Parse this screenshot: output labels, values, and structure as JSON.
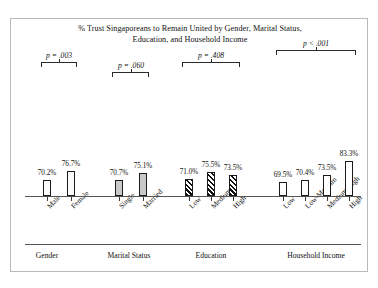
{
  "chart_data": {
    "type": "bar",
    "title": "% Trust Singaporeans to Remain United by Gender, Marital Status, Education, and Household Income",
    "title_line1": "% Trust Singaporeans to Remain United by Gender, Marital Status,",
    "title_line2": "Education, and Household Income",
    "xlabel": "",
    "ylabel": "",
    "ylim": [
      0,
      100
    ],
    "grid": false,
    "legend": "none",
    "value_suffix": "%",
    "groups": [
      {
        "name": "Gender",
        "p_label": "p = .003",
        "fill": "dotted",
        "categories": [
          "Male",
          "Female"
        ],
        "values": [
          70.2,
          76.7
        ],
        "value_labels": [
          "70.2%",
          "76.7%"
        ]
      },
      {
        "name": "Marital Status",
        "p_label": "p = .060",
        "fill": "solid-gray",
        "categories": [
          "Single",
          "Married"
        ],
        "values": [
          70.7,
          75.1
        ],
        "value_labels": [
          "70.7%",
          "75.1%"
        ]
      },
      {
        "name": "Education",
        "p_label": "p = .408",
        "fill": "diagonal-hatch",
        "categories": [
          "Low",
          "Medium",
          "High"
        ],
        "values": [
          71.0,
          75.5,
          73.5
        ],
        "value_labels": [
          "71.0%",
          "75.5%",
          "73.5%"
        ]
      },
      {
        "name": "Household Income",
        "p_label": "p < .001",
        "fill": "white",
        "categories": [
          "Low",
          "Low-Medium",
          "Medium-High",
          "High"
        ],
        "values": [
          69.5,
          70.4,
          73.5,
          83.3
        ],
        "value_labels": [
          "69.5%",
          "70.4%",
          "73.5%",
          "83.3%"
        ]
      }
    ],
    "colors": {
      "bar_outline": "#1a1a1a",
      "gray_fill": "#c9c9c9",
      "hatch": "#111111",
      "axis": "#555555",
      "frame": "#b9b9b9",
      "text": "#111111"
    }
  }
}
